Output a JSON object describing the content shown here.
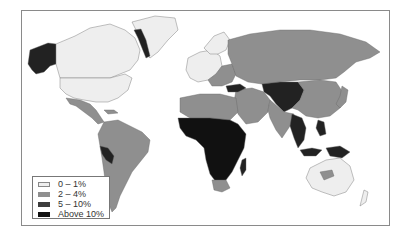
{
  "map": {
    "type": "choropleth",
    "region": "world",
    "classes": [
      {
        "label": "0 – 1%",
        "color": "#eeeeee"
      },
      {
        "label": "2 – 4%",
        "color": "#8f8f8f"
      },
      {
        "label": "5 – 10%",
        "color": "#3d3d3d"
      },
      {
        "label": "Above 10%",
        "color": "#111111"
      }
    ]
  },
  "legend": {
    "items": [
      {
        "label": "0 – 1%",
        "color": "#eeeeee"
      },
      {
        "label": "2 – 4%",
        "color": "#8f8f8f"
      },
      {
        "label": "5 – 10%",
        "color": "#3d3d3d"
      },
      {
        "label": "Above 10%",
        "color": "#111111"
      }
    ]
  }
}
